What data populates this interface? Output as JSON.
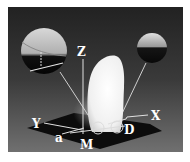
{
  "figure": {
    "labels": {
      "z": "Z",
      "y": "Y",
      "x": "X",
      "a": "a",
      "m": "M",
      "d": "D"
    },
    "colors": {
      "background": "#ffffff",
      "panel_top": "#232323",
      "panel_bottom": "#6c6c6c",
      "ground_plane": "#0c0c0c",
      "droplet": "#f4f4f4",
      "label": "#ffffff"
    }
  }
}
